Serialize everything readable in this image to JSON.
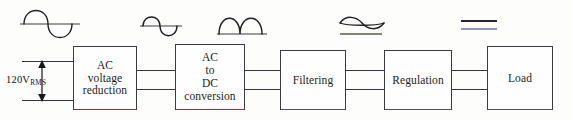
{
  "diagram": {
    "input": {
      "voltage_value": "120V",
      "voltage_subscript": "RMS",
      "arrow_up_icon": "arrow-up-icon",
      "arrow_down_icon": "arrow-down-icon"
    },
    "blocks": [
      {
        "id": "ac-voltage-reduction",
        "label": "AC\nvoltage\nreduction"
      },
      {
        "id": "ac-to-dc-conversion",
        "label": "AC\nto\nDC\nconversion"
      },
      {
        "id": "filtering",
        "label": "Filtering"
      },
      {
        "id": "regulation",
        "label": "Regulation"
      },
      {
        "id": "load",
        "label": "Load"
      }
    ],
    "waveforms": [
      {
        "id": "waveform-line-ac-input",
        "name": "full-amplitude-sine-wave",
        "description": "120V RMS line AC sine wave"
      },
      {
        "id": "waveform-reduced-ac",
        "name": "reduced-amplitude-sine-wave",
        "description": "Stepped-down AC sine wave"
      },
      {
        "id": "waveform-rectified-dc",
        "name": "full-wave-rectified-wave",
        "description": "Pulsating DC, two humps"
      },
      {
        "id": "waveform-filtered-ripple",
        "name": "ripple-dc-wave",
        "description": "Filtered DC with small ripple"
      },
      {
        "id": "waveform-regulated-dc",
        "name": "flat-dc-line",
        "description": "Regulated constant DC"
      }
    ],
    "wire_count_per_link": 2,
    "colors": {
      "ink": "#2b2b2b",
      "box_border": "#3a3a42",
      "background": "#fdfdfc",
      "fringe_red": "#be4646",
      "fringe_blue": "#6a74b4"
    }
  }
}
